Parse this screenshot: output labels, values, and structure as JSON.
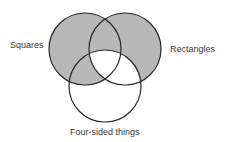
{
  "diagram": {
    "type": "venn",
    "sets": [
      {
        "id": "A",
        "label": "Squares",
        "cx": 85,
        "cy": 49,
        "r": 36
      },
      {
        "id": "B",
        "label": "Rectangles",
        "cx": 125,
        "cy": 49,
        "r": 36
      },
      {
        "id": "C",
        "label": "Four-sided things",
        "cx": 105,
        "cy": 86,
        "r": 36
      }
    ],
    "shaded_regions": [
      "A only",
      "B only",
      "A∩B not C",
      "A∩C not B"
    ],
    "unshaded_regions": [
      "A∩B∩C",
      "B∩C not A",
      "C only"
    ],
    "colors": {
      "shade": "#b8b8b8",
      "stroke": "#2a2a2a",
      "background": "#ffffff",
      "text": "#3a3a3a"
    }
  },
  "labels": {
    "squares": "Squares",
    "rectangles": "Rectangles",
    "four_sided": "Four-sided things"
  }
}
